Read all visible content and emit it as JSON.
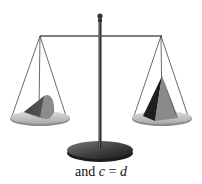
{
  "figure": {
    "type": "balance-scale-illustration",
    "caption": {
      "prefix": "and ",
      "left_var": "c",
      "operator": " = ",
      "right_var": "d"
    },
    "left_pan": {
      "object": "cone"
    },
    "right_pan": {
      "object": "pyramid"
    },
    "colors": {
      "metal_dark": "#2a2a2a",
      "pan_light": "#c8c8c8",
      "shape_mid": "#808080",
      "shape_dark": "#1e1e1e",
      "base_dark": "#3a3a3a",
      "string": "#444444"
    }
  }
}
